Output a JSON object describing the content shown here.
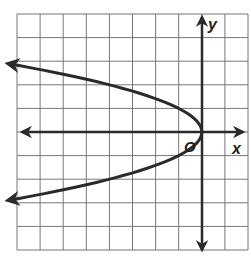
{
  "chart_data": {
    "type": "line",
    "title": "",
    "xlabel": "x",
    "ylabel": "y",
    "origin_label": "O",
    "xlim": [
      -8,
      2
    ],
    "ylim": [
      -5,
      5
    ],
    "grid": true,
    "grid_step": 1,
    "series": [
      {
        "name": "x = -y^2",
        "equation": "x = -y^2",
        "vertex": [
          0,
          0
        ],
        "opens": "left",
        "points": [
          [
            -8,
            2.83
          ],
          [
            -4,
            2
          ],
          [
            -1,
            1
          ],
          [
            0,
            0
          ],
          [
            -1,
            -1
          ],
          [
            -4,
            -2
          ],
          [
            -8,
            -2.83
          ]
        ]
      }
    ]
  },
  "labels": {
    "x_axis": "x",
    "y_axis": "y",
    "origin": "O"
  },
  "colors": {
    "grid": "#777777",
    "axis": "#2a2a2a",
    "curve": "#2a2a2a"
  }
}
